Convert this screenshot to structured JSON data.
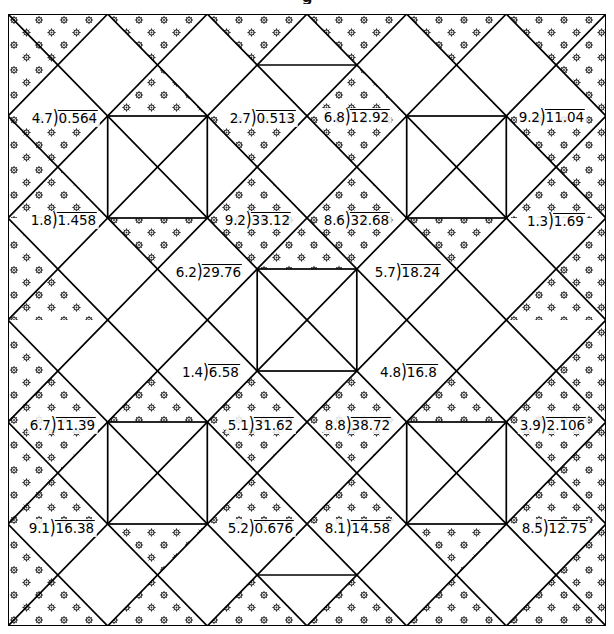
{
  "page": {
    "title": "g",
    "width": 614,
    "height": 634,
    "background": "#ffffff",
    "ink": "#1a1a1a"
  },
  "quilt": {
    "name": "division-quilt",
    "border_color": "#000000",
    "fill_color": "#ffffff",
    "motif_color": "#2b2b2b",
    "motif": "flower-dot",
    "grid_columns": 6,
    "grid_rows": 6,
    "cell_size": 99.7
  },
  "problems": [
    {
      "id": "p1",
      "divisor": "4.7",
      "dividend": "0.564",
      "x": 65,
      "y": 118
    },
    {
      "id": "p2",
      "divisor": "2.7",
      "dividend": "0.513",
      "x": 263,
      "y": 118
    },
    {
      "id": "p3",
      "divisor": "6.8",
      "dividend": "12.92",
      "x": 357,
      "y": 117
    },
    {
      "id": "p4",
      "divisor": "9.2",
      "dividend": "11.04",
      "x": 552,
      "y": 117
    },
    {
      "id": "p5",
      "divisor": "1.8",
      "dividend": "1.458",
      "x": 64,
      "y": 220
    },
    {
      "id": "p6",
      "divisor": "9.2",
      "dividend": "33.12",
      "x": 258,
      "y": 220
    },
    {
      "id": "p7",
      "divisor": "8.6",
      "dividend": "32.68",
      "x": 357,
      "y": 220
    },
    {
      "id": "p8",
      "divisor": "1.3",
      "dividend": "1.69",
      "x": 556,
      "y": 221
    },
    {
      "id": "p9",
      "divisor": "6.2",
      "dividend": "29.76",
      "x": 209,
      "y": 272
    },
    {
      "id": "p10",
      "divisor": "5.7",
      "dividend": "18.24",
      "x": 408,
      "y": 272
    },
    {
      "id": "p11",
      "divisor": "1.4",
      "dividend": "6.58",
      "x": 211,
      "y": 372
    },
    {
      "id": "p12",
      "divisor": "4.8",
      "dividend": "16.8",
      "x": 409,
      "y": 372
    },
    {
      "id": "p13",
      "divisor": "6.7",
      "dividend": "11.39",
      "x": 63,
      "y": 425
    },
    {
      "id": "p14",
      "divisor": "5.1",
      "dividend": "31.62",
      "x": 261,
      "y": 425
    },
    {
      "id": "p15",
      "divisor": "8.8",
      "dividend": "38.72",
      "x": 358,
      "y": 425
    },
    {
      "id": "p16",
      "divisor": "3.9",
      "dividend": "2.106",
      "x": 553,
      "y": 425
    },
    {
      "id": "p17",
      "divisor": "9.1",
      "dividend": "16.38",
      "x": 62,
      "y": 528
    },
    {
      "id": "p18",
      "divisor": "5.2",
      "dividend": "0.676",
      "x": 261,
      "y": 528
    },
    {
      "id": "p19",
      "divisor": "8.1",
      "dividend": "14.58",
      "x": 358,
      "y": 528
    },
    {
      "id": "p20",
      "divisor": "8.5",
      "dividend": "12.75",
      "x": 555,
      "y": 528
    }
  ],
  "division_bracket_glyph": ")"
}
